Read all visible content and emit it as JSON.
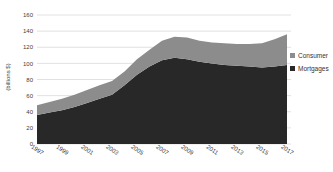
{
  "chart_data": {
    "type": "area",
    "stacked": true,
    "title": "",
    "xlabel": "",
    "ylabel": "(billions $)",
    "x": [
      1997,
      1998,
      1999,
      2000,
      2001,
      2002,
      2003,
      2004,
      2005,
      2006,
      2007,
      2008,
      2009,
      2010,
      2011,
      2012,
      2013,
      2014,
      2015,
      2016,
      2017
    ],
    "series": [
      {
        "name": "Mortgages",
        "color": "#282828",
        "values": [
          36,
          39,
          42,
          46,
          51,
          56,
          61,
          73,
          86,
          96,
          104,
          107,
          105,
          102,
          100,
          98,
          97,
          96,
          95,
          96,
          98
        ]
      },
      {
        "name": "Consumer",
        "color": "#8c8c8c",
        "values": [
          12,
          13,
          14,
          15,
          16,
          17,
          17,
          17,
          19,
          21,
          24,
          26,
          27,
          26,
          26,
          27,
          27,
          28,
          30,
          34,
          38
        ]
      }
    ],
    "ylim": [
      0,
      160
    ],
    "yticks": [
      0,
      20,
      40,
      60,
      80,
      100,
      120,
      140,
      160
    ],
    "xticks": [
      1997,
      1999,
      2001,
      2003,
      2005,
      2007,
      2009,
      2011,
      2013,
      2015,
      2017
    ],
    "grid": "horizontal",
    "gridline_color": "#d9d9d9",
    "legend_position": "right",
    "legend": [
      {
        "label": "Consumer",
        "color": "#8c8c8c"
      },
      {
        "label": "Mortgages",
        "color": "#282828"
      }
    ]
  }
}
